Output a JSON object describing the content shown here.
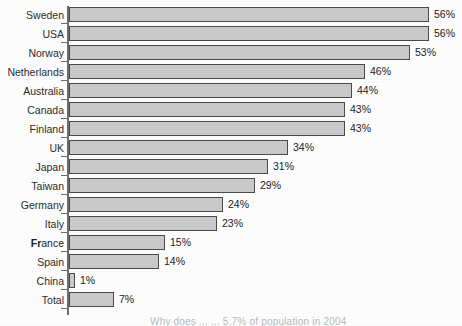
{
  "chart_data": {
    "type": "bar",
    "orientation": "horizontal",
    "title": "",
    "xlabel": "",
    "ylabel": "",
    "grid": false,
    "legend": null,
    "xlim": [
      0,
      56
    ],
    "value_suffix": "%",
    "bar_color": "#c9c9c9",
    "bar_border_color": "#4a4a4a",
    "axis_color": "#6d6d6d",
    "categories": [
      "Sweden",
      "USA",
      "Norway",
      "Netherlands",
      "Australia",
      "Canada",
      "Finland",
      "UK",
      "Japan",
      "Taiwan",
      "Germany",
      "Italy",
      "France",
      "Spain",
      "China",
      "Total"
    ],
    "values": [
      56,
      56,
      53,
      46,
      44,
      43,
      43,
      34,
      31,
      29,
      24,
      23,
      15,
      14,
      1,
      7
    ],
    "value_labels": [
      "56%",
      "56%",
      "53%",
      "46%",
      "44%",
      "43%",
      "43%",
      "34%",
      "31%",
      "29%",
      "24%",
      "23%",
      "15%",
      "14%",
      "1%",
      "7%"
    ]
  },
  "caption": {
    "text": "Why does ... ... 5.7% of population in 2004"
  }
}
